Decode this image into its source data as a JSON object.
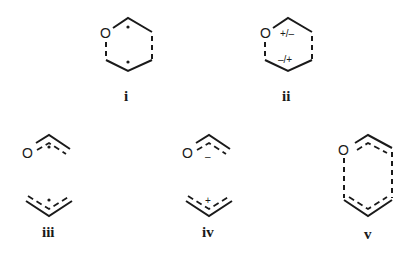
{
  "figure": {
    "structures": [
      {
        "id": "i",
        "label": "i",
        "atom": "O",
        "description": "six-membered ring (O-containing) with partial bonds and two radical dots",
        "annotations": [
          "•",
          "•"
        ]
      },
      {
        "id": "ii",
        "label": "ii",
        "atom": "O",
        "description": "six-membered ring (O-containing) with zwitterionic charges",
        "annotations": [
          "+/–",
          "–/+"
        ]
      },
      {
        "id": "iii",
        "label": "iii",
        "atom": "O",
        "description": "oxallyl radical and allyl radical fragments",
        "annotations": [
          "•",
          "•"
        ]
      },
      {
        "id": "iv",
        "label": "iv",
        "atom": "O",
        "description": "oxallyl anion and allyl cation fragments",
        "annotations": [
          "–",
          "+"
        ]
      },
      {
        "id": "v",
        "label": "v",
        "atom": "O",
        "description": "delocalized six-membered transition-state ring with dashed long bonds",
        "annotations": []
      }
    ]
  }
}
